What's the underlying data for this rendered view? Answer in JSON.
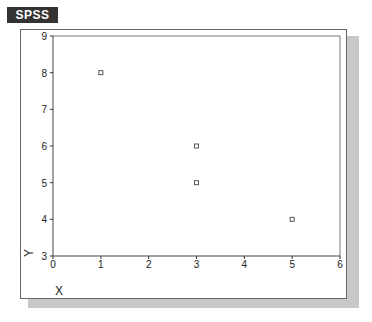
{
  "header": {
    "logo_text": "SPSS"
  },
  "chart_data": {
    "type": "scatter",
    "title": "",
    "xlabel": "X",
    "ylabel": "Y",
    "xlim": [
      0,
      6
    ],
    "ylim": [
      3,
      9
    ],
    "xticks": [
      "0",
      "1",
      "2",
      "3",
      "4",
      "5",
      "6"
    ],
    "yticks": [
      "3",
      "4",
      "5",
      "6",
      "7",
      "8",
      "9"
    ],
    "grid": false,
    "legend": "none",
    "points": [
      {
        "x": 1,
        "y": 8
      },
      {
        "x": 3,
        "y": 6
      },
      {
        "x": 3,
        "y": 5
      },
      {
        "x": 5,
        "y": 4
      }
    ]
  }
}
